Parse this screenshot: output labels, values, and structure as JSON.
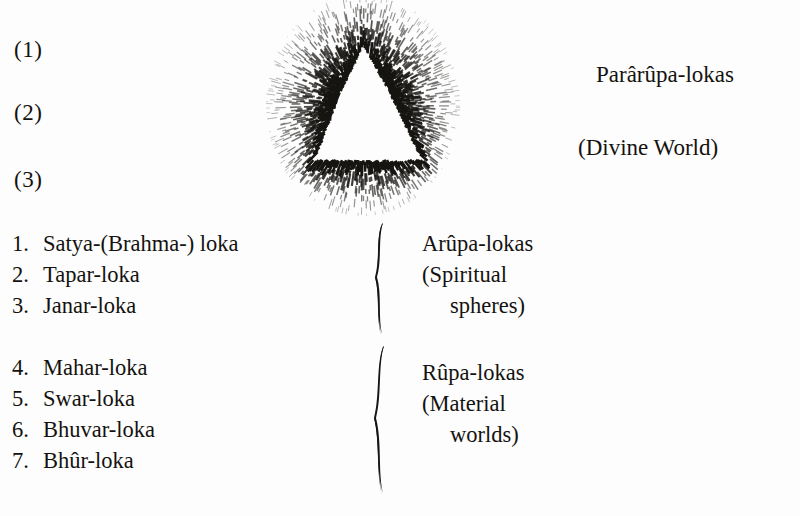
{
  "page": {
    "background_color": "#fdfdfd",
    "ink_color": "#14120f"
  },
  "markers": [
    {
      "label": "(1)"
    },
    {
      "label": "(2)"
    },
    {
      "label": "(3)"
    }
  ],
  "emblem": {
    "name": "radiant-triangle-sunburst",
    "description": "White triangle surrounded by a halo of short radiating dashes"
  },
  "right_captions": {
    "pararupa": "Parârûpa-lokas",
    "divine": "(Divine World)"
  },
  "groups": [
    {
      "id": "arupa",
      "items": [
        {
          "num": "1.",
          "name": "Satya-(Brahma-) loka"
        },
        {
          "num": "2.",
          "name": "Tapar-loka"
        },
        {
          "num": "3.",
          "name": "Janar-loka"
        }
      ],
      "caption": {
        "title": "Arûpa-lokas",
        "sub_line_1": "(Spiritual",
        "sub_line_2": "spheres)"
      }
    },
    {
      "id": "rupa",
      "items": [
        {
          "num": "4.",
          "name": "Mahar-loka"
        },
        {
          "num": "5.",
          "name": "Swar-loka"
        },
        {
          "num": "6.",
          "name": "Bhuvar-loka"
        },
        {
          "num": "7.",
          "name": "Bhûr-loka"
        }
      ],
      "caption": {
        "title": "Rûpa-lokas",
        "sub_line_1": "(Material",
        "sub_line_2": "worlds)"
      }
    }
  ]
}
